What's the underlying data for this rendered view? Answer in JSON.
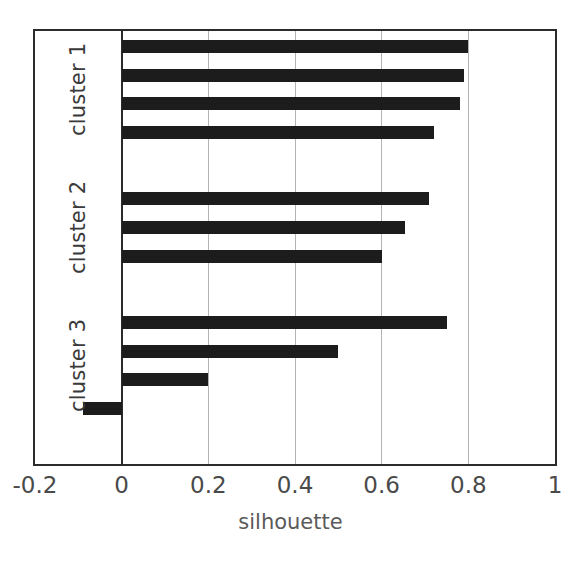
{
  "chart_data": {
    "type": "bar",
    "orientation": "horizontal",
    "title": "",
    "xlabel": "silhouette",
    "ylabel": "",
    "xlim": [
      -0.2,
      1.0
    ],
    "xticks": [
      -0.2,
      0,
      0.2,
      0.4,
      0.6,
      0.8,
      1
    ],
    "xtick_labels": [
      "-0.2",
      "0",
      "0.2",
      "0.4",
      "0.6",
      "0.8",
      "1"
    ],
    "gridlines": [
      0.2,
      0.4,
      0.6,
      0.8
    ],
    "zero_reference": 0,
    "grid": true,
    "legend": "none",
    "bar_color": "#1c1c1c",
    "groups": [
      {
        "label": "cluster 1",
        "values": [
          0.8,
          0.79,
          0.78,
          0.72
        ]
      },
      {
        "label": "cluster 2",
        "values": [
          0.71,
          0.655,
          0.6
        ]
      },
      {
        "label": "cluster 3",
        "values": [
          0.75,
          0.5,
          0.2,
          -0.09
        ]
      }
    ],
    "all_values": [
      0.8,
      0.79,
      0.78,
      0.72,
      0.71,
      0.655,
      0.6,
      0.75,
      0.5,
      0.2,
      -0.09
    ]
  },
  "axis": {
    "x_title": "silhouette"
  },
  "colors": {
    "bar": "#1c1c1c",
    "grid": "#b4b4b4",
    "frame": "#2b2b2b",
    "tick_text": "#4a4a4a",
    "label_text": "#3a3a3a",
    "title_text": "#5a5a5a",
    "background": "#ffffff"
  }
}
